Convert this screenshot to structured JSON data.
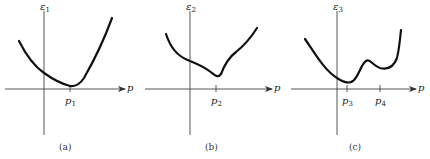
{
  "panels": [
    {
      "id": "a",
      "caption": "(a)",
      "y_axis_label": "ε",
      "y_axis_sub": "1",
      "x_axis_label": "p",
      "ticks": [
        {
          "label": "p",
          "sub": "1"
        }
      ],
      "description": "Single smooth minimum at p1"
    },
    {
      "id": "b",
      "caption": "(b)",
      "y_axis_label": "ε",
      "y_axis_sub": "2",
      "x_axis_label": "p",
      "ticks": [
        {
          "label": "p",
          "sub": "2"
        }
      ],
      "description": "Sharp (cusp-like) minimum at p2"
    },
    {
      "id": "c",
      "caption": "(c)",
      "y_axis_label": "ε",
      "y_axis_sub": "3",
      "x_axis_label": "p",
      "ticks": [
        {
          "label": "p",
          "sub": "3"
        },
        {
          "label": "p",
          "sub": "4"
        }
      ],
      "description": "Global minimum at p3 and local minimum at p4"
    }
  ],
  "colors": {
    "curve": "#1a1a1a",
    "axis": "#333333",
    "background": "#ffffff"
  }
}
